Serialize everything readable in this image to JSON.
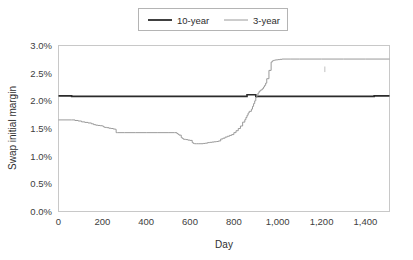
{
  "chart_data": {
    "type": "line",
    "title": "",
    "xlabel": "Day",
    "ylabel": "Swap initial margin",
    "xlim": [
      0,
      1510
    ],
    "ylim": [
      0,
      3.0
    ],
    "xticks": [
      0,
      200,
      400,
      600,
      800,
      1000,
      1200,
      1400
    ],
    "xticklabels": [
      "0",
      "200",
      "400",
      "600",
      "800",
      "1,000",
      "1,200",
      "1,400"
    ],
    "yticks": [
      0.0,
      0.5,
      1.0,
      1.5,
      2.0,
      2.5,
      3.0
    ],
    "yticklabels": [
      "0.0%",
      "0.5%",
      "1.0%",
      "1.5%",
      "2.0%",
      "2.5%",
      "3.0%"
    ],
    "grid": false,
    "legend_position": "top-center",
    "series": [
      {
        "name": "10-year",
        "color": "#2b2b2b",
        "width": 1.6,
        "x": [
          0,
          30,
          60,
          90,
          120,
          160,
          200,
          240,
          280,
          320,
          360,
          400,
          440,
          480,
          520,
          560,
          600,
          640,
          680,
          700,
          720,
          760,
          800,
          840,
          860,
          880,
          900,
          920,
          940,
          960,
          1000,
          1040,
          1080,
          1120,
          1160,
          1200,
          1260,
          1320,
          1380,
          1440,
          1510
        ],
        "y": [
          2.09,
          2.09,
          2.08,
          2.08,
          2.08,
          2.08,
          2.08,
          2.08,
          2.08,
          2.08,
          2.08,
          2.08,
          2.08,
          2.08,
          2.08,
          2.08,
          2.08,
          2.08,
          2.08,
          2.08,
          2.08,
          2.08,
          2.08,
          2.08,
          2.11,
          2.11,
          2.08,
          2.08,
          2.08,
          2.08,
          2.08,
          2.08,
          2.08,
          2.08,
          2.08,
          2.08,
          2.08,
          2.08,
          2.08,
          2.09,
          2.09
        ]
      },
      {
        "name": "3-year",
        "color": "#9a9a9a",
        "width": 1.0,
        "x": [
          0,
          60,
          75,
          90,
          105,
          120,
          135,
          150,
          160,
          170,
          180,
          190,
          200,
          205,
          210,
          220,
          230,
          240,
          250,
          260,
          262,
          263,
          270,
          300,
          350,
          400,
          450,
          500,
          530,
          540,
          545,
          550,
          560,
          565,
          570,
          580,
          590,
          600,
          610,
          615,
          620,
          630,
          640,
          650,
          660,
          670,
          680,
          690,
          700,
          710,
          720,
          730,
          740,
          750,
          760,
          770,
          780,
          790,
          800,
          810,
          820,
          830,
          840,
          850,
          855,
          860,
          865,
          870,
          880,
          885,
          890,
          895,
          900,
          905,
          910,
          915,
          920,
          925,
          930,
          935,
          940,
          945,
          950,
          960,
          970,
          975,
          980,
          985,
          990,
          1000,
          1010,
          1020,
          1060,
          1100,
          1200,
          1300,
          1400,
          1510
        ],
        "y": [
          1.655,
          1.655,
          1.645,
          1.635,
          1.62,
          1.61,
          1.6,
          1.585,
          1.57,
          1.56,
          1.555,
          1.55,
          1.545,
          1.53,
          1.52,
          1.515,
          1.505,
          1.5,
          1.49,
          1.485,
          1.485,
          1.425,
          1.425,
          1.425,
          1.425,
          1.425,
          1.425,
          1.425,
          1.425,
          1.41,
          1.395,
          1.38,
          1.335,
          1.32,
          1.305,
          1.3,
          1.29,
          1.285,
          1.245,
          1.23,
          1.225,
          1.225,
          1.225,
          1.225,
          1.23,
          1.235,
          1.245,
          1.25,
          1.255,
          1.26,
          1.265,
          1.275,
          1.31,
          1.325,
          1.345,
          1.36,
          1.375,
          1.39,
          1.425,
          1.46,
          1.5,
          1.545,
          1.615,
          1.66,
          1.7,
          1.74,
          1.78,
          1.81,
          1.85,
          1.9,
          1.95,
          2.0,
          2.06,
          2.1,
          2.14,
          2.17,
          2.19,
          2.2,
          2.22,
          2.25,
          2.28,
          2.32,
          2.4,
          2.55,
          2.7,
          2.72,
          2.73,
          2.735,
          2.74,
          2.745,
          2.75,
          2.755,
          2.755,
          2.755,
          2.755,
          2.755,
          2.755,
          2.755
        ]
      }
    ],
    "annotations": [
      {
        "name": "minor-tick-mark",
        "x": 1215,
        "y_top": 2.62,
        "y_bottom": 2.52
      }
    ]
  },
  "legend": {
    "entries": [
      {
        "label": "10-year",
        "color": "#2b2b2b",
        "width": 1.8
      },
      {
        "label": "3-year",
        "color": "#9a9a9a",
        "width": 1.0
      }
    ]
  }
}
